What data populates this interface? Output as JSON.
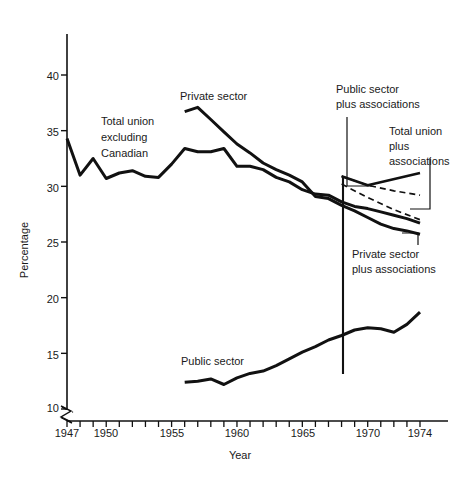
{
  "chart_data": {
    "type": "line",
    "title": "",
    "xlabel": "Year",
    "ylabel": "Percentage",
    "xlim": [
      1947,
      1974
    ],
    "ylim": [
      10,
      42
    ],
    "grid": false,
    "axis_break_y": true,
    "legend_position": "inline-annotations",
    "y_ticks": [
      10,
      15,
      20,
      25,
      30,
      35,
      40
    ],
    "y_tick_labels": [
      "10",
      "15",
      "20",
      "25",
      "30",
      "35",
      "40"
    ],
    "x_ticks": [
      1947,
      1948,
      1949,
      1950,
      1951,
      1952,
      1953,
      1954,
      1955,
      1956,
      1957,
      1958,
      1959,
      1960,
      1961,
      1962,
      1963,
      1964,
      1965,
      1966,
      1967,
      1968,
      1969,
      1970,
      1971,
      1972,
      1973,
      1974
    ],
    "x_tick_labels_shown": [
      "1947",
      "1950",
      "1955",
      "1960",
      "1965",
      "1970",
      "1974"
    ],
    "x_tick_label_years": [
      1947,
      1950,
      1955,
      1960,
      1965,
      1970,
      1974
    ],
    "series": [
      {
        "name": "Total union excluding Canadian",
        "style": "solid",
        "x": [
          1947,
          1948,
          1949,
          1950,
          1951,
          1952,
          1953,
          1954,
          1955,
          1956,
          1957,
          1958,
          1959,
          1960,
          1961,
          1962,
          1963,
          1964,
          1965,
          1966,
          1967,
          1968,
          1969,
          1970,
          1971,
          1972,
          1973,
          1974
        ],
        "values": [
          34.3,
          31.0,
          32.5,
          30.7,
          31.2,
          31.4,
          30.9,
          30.8,
          32.0,
          33.4,
          33.1,
          33.1,
          33.4,
          31.8,
          31.8,
          31.5,
          30.8,
          30.4,
          29.7,
          29.3,
          29.2,
          28.6,
          28.2,
          28.0,
          27.7,
          27.4,
          27.1,
          26.7
        ]
      },
      {
        "name": "Private sector",
        "style": "solid",
        "x": [
          1956,
          1957,
          1958,
          1959,
          1960,
          1961,
          1962,
          1963,
          1964,
          1965,
          1966,
          1967,
          1968,
          1969,
          1970,
          1971,
          1972,
          1973,
          1974
        ],
        "values": [
          36.7,
          37.1,
          36.0,
          34.9,
          33.8,
          33.0,
          32.1,
          31.5,
          31.0,
          30.4,
          29.1,
          28.9,
          28.3,
          27.8,
          27.2,
          26.6,
          26.2,
          26.0,
          25.7
        ]
      },
      {
        "name": "Public sector",
        "style": "solid",
        "x": [
          1956,
          1957,
          1958,
          1959,
          1960,
          1961,
          1962,
          1963,
          1964,
          1965,
          1966,
          1967,
          1968,
          1969,
          1970,
          1971,
          1972,
          1973,
          1974
        ],
        "values": [
          12.4,
          12.5,
          12.7,
          12.2,
          12.8,
          13.2,
          13.4,
          13.9,
          14.5,
          15.1,
          15.6,
          16.2,
          16.6,
          17.1,
          17.3,
          17.2,
          16.9,
          17.6,
          18.7
        ]
      },
      {
        "name": "Public sector plus associations",
        "style": "solid",
        "x": [
          1968,
          1970,
          1974
        ],
        "values": [
          30.9,
          30.1,
          31.2
        ]
      },
      {
        "name": "Total union plus associations",
        "style": "dashed",
        "x": [
          1968,
          1970,
          1972,
          1974
        ],
        "values": [
          30.9,
          30.1,
          29.6,
          29.2
        ]
      },
      {
        "name": "Private sector plus associations",
        "style": "dashed",
        "x": [
          1968,
          1970,
          1972,
          1974
        ],
        "values": [
          30.2,
          29.0,
          27.9,
          27.0
        ]
      }
    ],
    "annotations": [
      {
        "text": "Total union\nexcluding\nCanadian",
        "lines": [
          "Total union",
          "excluding",
          "Canadian"
        ]
      },
      {
        "text": "Private sector",
        "lines": [
          "Private sector"
        ]
      },
      {
        "text": "Public sector",
        "lines": [
          "Public sector"
        ]
      },
      {
        "text": "Public sector\nplus associations",
        "lines": [
          "Public sector",
          "plus associations"
        ]
      },
      {
        "text": "Total union\nplus\nassociations",
        "lines": [
          "Total union",
          "plus",
          "associations"
        ]
      },
      {
        "text": "Private sector\nplus associations",
        "lines": [
          "Private sector",
          "plus associations"
        ]
      }
    ]
  },
  "labels": {
    "y_axis_title": "Percentage",
    "x_axis_title": "Year",
    "y_10": "10",
    "y_15": "15",
    "y_20": "20",
    "y_25": "25",
    "y_30": "30",
    "y_35": "35",
    "y_40": "40",
    "x_1947": "1947",
    "x_1950": "1950",
    "x_1955": "1955",
    "x_1960": "1960",
    "x_1965": "1965",
    "x_1970": "1970",
    "x_1974": "1974",
    "ann_total_union_1": "Total union",
    "ann_total_union_2": "excluding",
    "ann_total_union_3": "Canadian",
    "ann_private_sector": "Private sector",
    "ann_public_sector": "Public sector",
    "ann_public_plus_1": "Public sector",
    "ann_public_plus_2": "plus associations",
    "ann_total_plus_1": "Total union",
    "ann_total_plus_2": "plus",
    "ann_total_plus_3": "associations",
    "ann_private_plus_1": "Private sector",
    "ann_private_plus_2": "plus associations"
  },
  "colors": {
    "background": "#ffffff",
    "ink": "#111111",
    "axis": "#111111"
  }
}
